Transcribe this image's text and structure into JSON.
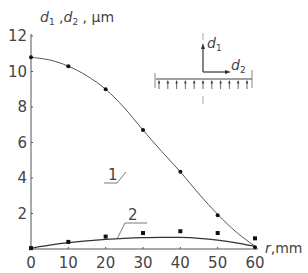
{
  "chart_data": {
    "type": "line",
    "title": "",
    "xlabel": "r, mm",
    "ylabel": "d1, d2, μm",
    "xlim": [
      0,
      60
    ],
    "ylim": [
      0,
      12
    ],
    "x_ticks": [
      0,
      10,
      20,
      30,
      40,
      50,
      60
    ],
    "y_ticks": [
      2,
      4,
      6,
      8,
      10,
      12
    ],
    "grid": false,
    "series": [
      {
        "name": "1",
        "label": "1",
        "marker": "dot",
        "points_x": [
          0,
          10,
          20,
          30,
          40,
          50,
          60
        ],
        "points_y": [
          10.8,
          10.3,
          9.0,
          6.7,
          4.35,
          1.9,
          0.1
        ],
        "curve_x": [
          0,
          5,
          10,
          15,
          20,
          25,
          30,
          35,
          40,
          45,
          50,
          55,
          60
        ],
        "curve_y": [
          10.8,
          10.65,
          10.3,
          9.75,
          9.0,
          7.95,
          6.7,
          5.5,
          4.35,
          3.1,
          1.95,
          0.95,
          0.15
        ]
      },
      {
        "name": "2",
        "label": "2",
        "marker": "square",
        "points_x": [
          0,
          10,
          20,
          30,
          40,
          50,
          60
        ],
        "points_y": [
          0.05,
          0.4,
          0.7,
          0.9,
          1.0,
          0.9,
          0.6
        ],
        "curve_x": [
          0,
          5,
          10,
          15,
          20,
          25,
          30,
          35,
          40,
          45,
          50,
          55,
          60
        ],
        "curve_y": [
          0.05,
          0.22,
          0.36,
          0.46,
          0.54,
          0.6,
          0.64,
          0.66,
          0.65,
          0.6,
          0.5,
          0.35,
          0.15
        ]
      }
    ],
    "annotations": [
      "1",
      "2"
    ],
    "inset": {
      "labels": [
        "d1",
        "d2"
      ],
      "description": "plate with upward distributed load arrows and displacement axes d1 (vertical) and d2 (horizontal)"
    }
  },
  "labels": {
    "ylabel_d": "d",
    "ylabel_sub1": "1",
    "ylabel_sep": " ,",
    "ylabel_sub2": "2",
    "ylabel_unit": " ,  μm",
    "xlabel_r": "r",
    "xlabel_unit": ",mm",
    "inset_d": "d",
    "inset_sub1": "1",
    "inset_sub2": "2",
    "curve1_label": "1",
    "curve2_label": "2"
  }
}
